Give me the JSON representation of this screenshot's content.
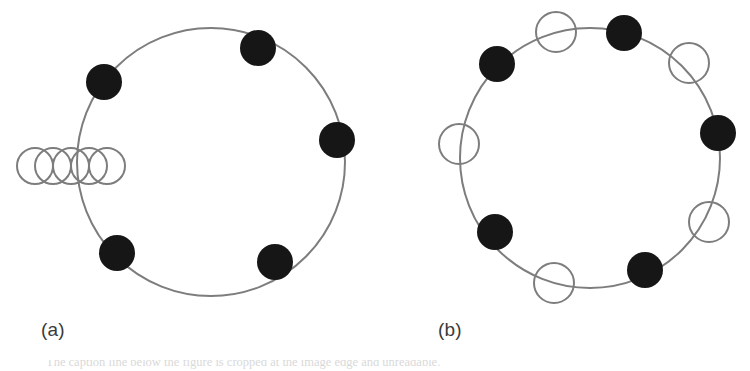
{
  "figure": {
    "background_color": "#ffffff",
    "ring_stroke_color": "#7d7d7d",
    "filled_node_color": "#161616",
    "open_node_stroke_color": "#7d7d7d",
    "label_color": "#3a3a3a",
    "panels": [
      {
        "id": "panel-a",
        "label": "(a)",
        "label_x": 41,
        "label_y": 320,
        "ring": {
          "cx": 211,
          "cy": 162,
          "r": 134,
          "stroke_width": 2
        },
        "filled_nodes": [
          {
            "cx": 258,
            "cy": 48,
            "r": 18
          },
          {
            "cx": 337,
            "cy": 140,
            "r": 18
          },
          {
            "cx": 275,
            "cy": 262,
            "r": 18
          },
          {
            "cx": 117,
            "cy": 253,
            "r": 18
          },
          {
            "cx": 104,
            "cy": 82,
            "r": 18
          }
        ],
        "open_nodes": [
          {
            "cx": 35,
            "cy": 166,
            "r": 18,
            "stroke_width": 2
          },
          {
            "cx": 53,
            "cy": 166,
            "r": 18,
            "stroke_width": 2
          },
          {
            "cx": 71,
            "cy": 166,
            "r": 18,
            "stroke_width": 2
          },
          {
            "cx": 89,
            "cy": 166,
            "r": 18,
            "stroke_width": 2
          },
          {
            "cx": 107,
            "cy": 166,
            "r": 18,
            "stroke_width": 2
          }
        ]
      },
      {
        "id": "panel-b",
        "label": "(b)",
        "label_x": 438,
        "label_y": 320,
        "ring": {
          "cx": 590,
          "cy": 158,
          "r": 130,
          "stroke_width": 2
        },
        "filled_nodes": [
          {
            "cx": 624,
            "cy": 33,
            "r": 18
          },
          {
            "cx": 718,
            "cy": 133,
            "r": 18
          },
          {
            "cx": 645,
            "cy": 270,
            "r": 18
          },
          {
            "cx": 495,
            "cy": 232,
            "r": 18
          },
          {
            "cx": 497,
            "cy": 64,
            "r": 18
          }
        ],
        "open_nodes": [
          {
            "cx": 556,
            "cy": 32,
            "r": 20,
            "stroke_width": 2
          },
          {
            "cx": 689,
            "cy": 63,
            "r": 20,
            "stroke_width": 2
          },
          {
            "cx": 709,
            "cy": 222,
            "r": 20,
            "stroke_width": 2
          },
          {
            "cx": 554,
            "cy": 283,
            "r": 20,
            "stroke_width": 2
          },
          {
            "cx": 459,
            "cy": 144,
            "r": 20,
            "stroke_width": 2
          }
        ]
      }
    ]
  },
  "caption": {
    "clipped_text": "The caption line below the figure is cropped at the image edge and unreadable."
  },
  "chart_data": {
    "type": "diagram",
    "title": "",
    "subtitle": "",
    "xlabel": "",
    "ylabel": "",
    "legend": [
      {
        "marker": "filled-circle",
        "meaning": "filled node"
      },
      {
        "marker": "open-circle",
        "meaning": "open node"
      }
    ],
    "panels": [
      {
        "label": "(a)",
        "description": "Ring with 5 filled nodes spaced around it and a horizontal chain of 5 overlapping open circles crossing the left arc.",
        "filled_node_count": 5,
        "open_node_count": 5,
        "open_node_arrangement": "horizontal overlapping chain on left side"
      },
      {
        "label": "(b)",
        "description": "Ring with 5 filled nodes alternating with 5 open nodes distributed around the ring.",
        "filled_node_count": 5,
        "open_node_count": 5,
        "open_node_arrangement": "alternating around ring"
      }
    ]
  }
}
